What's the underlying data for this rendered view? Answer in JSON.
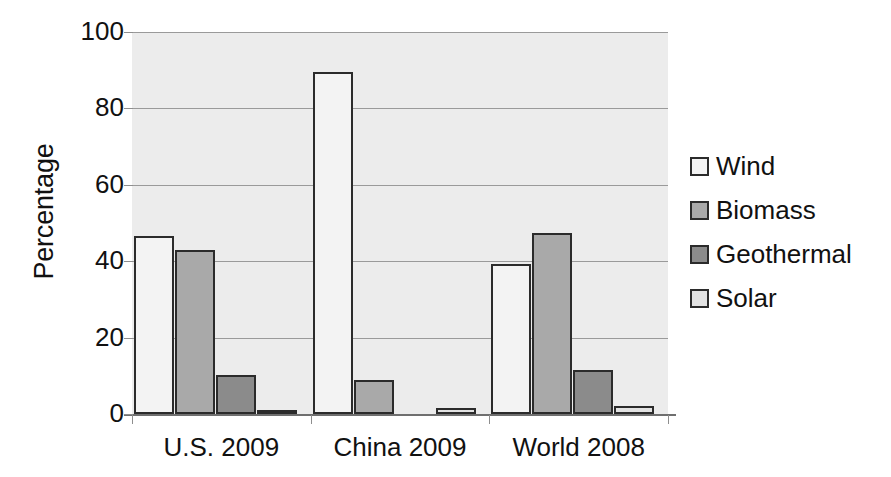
{
  "chart_data": {
    "type": "bar",
    "title": "",
    "xlabel": "",
    "ylabel": "Percentage",
    "ylim": [
      0,
      100
    ],
    "yticks": [
      0,
      20,
      40,
      60,
      80,
      100
    ],
    "ytick_labels": [
      "0",
      "20",
      "40",
      "60",
      "80",
      "100"
    ],
    "grid": true,
    "legend_position": "right",
    "categories": [
      "U.S. 2009",
      "China 2009",
      "World 2008"
    ],
    "series": [
      {
        "name": "Wind",
        "color": "#f3f3f3",
        "values": [
          46.5,
          89.5,
          39.3
        ]
      },
      {
        "name": "Biomass",
        "color": "#a9a9a9",
        "values": [
          43.0,
          8.8,
          47.5
        ]
      },
      {
        "name": "Geothermal",
        "color": "#8b8b8b",
        "values": [
          10.2,
          0.0,
          11.5
        ]
      },
      {
        "name": "Solar",
        "color": "#e2e2e2",
        "values": [
          0.5,
          1.5,
          2.1
        ]
      }
    ],
    "plot_background": "#ececec",
    "bar_border_color": "#2b2b2b",
    "gridline_color": "#9a9a9a"
  }
}
